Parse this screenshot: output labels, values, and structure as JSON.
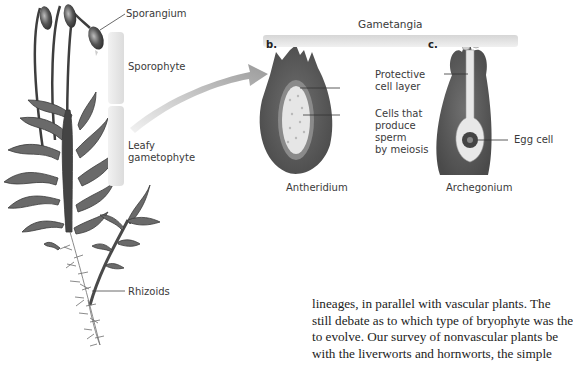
{
  "figure": {
    "plant": {
      "labels": {
        "sporangium": "Sporangium",
        "sporophyte": "Sporophyte",
        "leafy_gametophyte_line1": "Leafy",
        "leafy_gametophyte_line2": "gametophyte",
        "rhizoids": "Rhizoids"
      }
    },
    "gametangia": {
      "title": "Gametangia",
      "panel_b": {
        "letter": "b.",
        "caption": "Antheridium",
        "labels": {
          "protective_line1": "Protective",
          "protective_line2": "cell layer",
          "cells_line1": "Cells that",
          "cells_line2": "produce",
          "cells_line3": "sperm",
          "cells_line4": "by meiosis"
        }
      },
      "panel_c": {
        "letter": "c.",
        "caption": "Archegonium",
        "labels": {
          "egg_cell": "Egg cell"
        }
      }
    }
  },
  "body_text": {
    "lines": [
      "lineages, in parallel with vascular plants. The",
      "still debate as to which type of bryophyte was the",
      "to evolve. Our survey of nonvascular plants be",
      "with the liverworts and hornworts, the simple"
    ]
  }
}
